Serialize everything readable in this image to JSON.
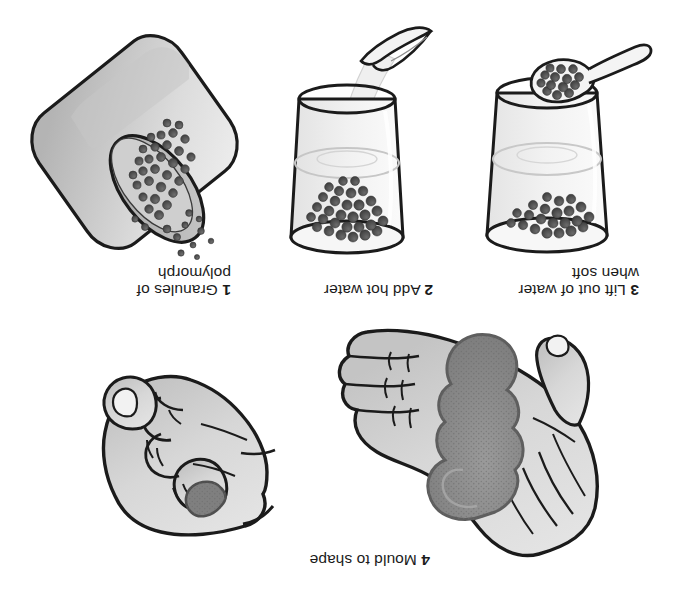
{
  "document": {
    "title": "Polymorph moulding instructions",
    "orientation": "upside-down",
    "background_color": "#ffffff"
  },
  "palette": {
    "ink": "#1b1b1b",
    "text": "#1b1b1b",
    "skin_light": "#d9d9d9",
    "skin_shadow": "#c2c2c2",
    "material_grey": "#8a8a8a",
    "material_dark": "#6f6f6f",
    "granule_dark": "#4a4a4a",
    "granule_mid": "#5d5d5d",
    "glass_light": "#f4f4f4",
    "glass_tint": "#e8e8e8",
    "cup_body": "#dcdcdc",
    "cup_shadow": "#b9b9b9",
    "water_stream": "#efefef"
  },
  "steps": [
    {
      "id": "step-1",
      "number": "1",
      "label": "Granules of\npolymorph",
      "illustration": "tilted-cup-pouring-granules",
      "caption_x": 455,
      "caption_y": 12,
      "panel_x": 412,
      "panel_y": 40
    },
    {
      "id": "step-2",
      "number": "2",
      "label": "Add hot water",
      "illustration": "glass-with-granules-and-kettle-stream",
      "caption_x": 248,
      "caption_y": 30,
      "panel_x": 228,
      "panel_y": 58
    },
    {
      "id": "step-3",
      "number": "3",
      "label": "Lift out of water\nwhen soft",
      "illustration": "glass-with-spoon-lifting-granules",
      "caption_x": 46,
      "caption_y": 12,
      "panel_x": 30,
      "panel_y": 58
    },
    {
      "id": "step-4",
      "number": "4",
      "label": "Mould to shape",
      "illustration": "open-hand-with-soft-lump-and-closed-fist",
      "caption_x": 253,
      "caption_y": 19,
      "panel_x": 55,
      "panel_y": 40
    }
  ],
  "captions": {
    "step1": "1 Granules of\npolymorph",
    "step2": "2 Add hot water",
    "step3": "3 Lift out of water\nwhen soft",
    "step4": "4 Mould to shape"
  }
}
